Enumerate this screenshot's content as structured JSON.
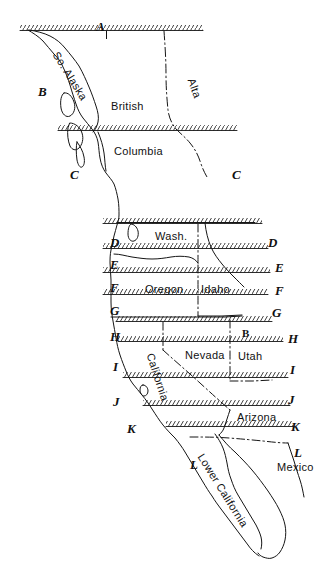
{
  "map": {
    "title": "Hand-drawn index map of Western North America",
    "background_color": "#ffffff",
    "ink_color": "#111111",
    "width": 323,
    "height": 579,
    "grid_letters_left": [
      "B",
      "C",
      "D",
      "E",
      "F",
      "G",
      "H",
      "I",
      "J",
      "K",
      "L"
    ],
    "grid_letters_right": [
      "C",
      "D",
      "E",
      "F",
      "G",
      "H",
      "I",
      "J",
      "K",
      "L"
    ],
    "grid_letter_top": "A"
  },
  "grid": {
    "top": {
      "letter": "A",
      "x": 96,
      "y": 20
    },
    "left": [
      {
        "letter": "B",
        "x": 38,
        "y": 85
      },
      {
        "letter": "C",
        "x": 70,
        "y": 168
      },
      {
        "letter": "D",
        "x": 110,
        "y": 236
      },
      {
        "letter": "E",
        "x": 110,
        "y": 258
      },
      {
        "letter": "F",
        "x": 110,
        "y": 281
      },
      {
        "letter": "G",
        "x": 110,
        "y": 304
      },
      {
        "letter": "H",
        "x": 110,
        "y": 330
      },
      {
        "letter": "I",
        "x": 113,
        "y": 360
      },
      {
        "letter": "J",
        "x": 113,
        "y": 395
      },
      {
        "letter": "K",
        "x": 127,
        "y": 422
      },
      {
        "letter": "L",
        "x": 190,
        "y": 458
      }
    ],
    "right": [
      {
        "letter": "C",
        "x": 232,
        "y": 168
      },
      {
        "letter": "D",
        "x": 268,
        "y": 236
      },
      {
        "letter": "E",
        "x": 275,
        "y": 261
      },
      {
        "letter": "F",
        "x": 275,
        "y": 284
      },
      {
        "letter": "G",
        "x": 272,
        "y": 306
      },
      {
        "letter": "H",
        "x": 288,
        "y": 332
      },
      {
        "letter": "I",
        "x": 290,
        "y": 363
      },
      {
        "letter": "J",
        "x": 288,
        "y": 393
      },
      {
        "letter": "K",
        "x": 291,
        "y": 420
      },
      {
        "letter": "L",
        "x": 294,
        "y": 446
      }
    ],
    "marker_b_small": {
      "letter": "B",
      "x": 242,
      "y": 328
    }
  },
  "places": [
    {
      "name": "So. Alaska",
      "x": 60,
      "y": 50,
      "rotate": 58,
      "size": 11
    },
    {
      "name": "British",
      "x": 111,
      "y": 101,
      "rotate": 0,
      "size": 11
    },
    {
      "name": "Columbia",
      "x": 114,
      "y": 146,
      "rotate": 0,
      "size": 11
    },
    {
      "name": "Alta",
      "x": 196,
      "y": 77,
      "rotate": 70,
      "size": 11
    },
    {
      "name": "Wash.",
      "x": 155,
      "y": 231,
      "rotate": 0,
      "size": 11
    },
    {
      "name": "Oregon",
      "x": 145,
      "y": 284,
      "rotate": 0,
      "size": 11
    },
    {
      "name": "Idaho",
      "x": 201,
      "y": 284,
      "rotate": 0,
      "size": 11
    },
    {
      "name": "Nevada",
      "x": 185,
      "y": 350,
      "rotate": 0,
      "size": 11
    },
    {
      "name": "Utah",
      "x": 238,
      "y": 351,
      "rotate": 0,
      "size": 11
    },
    {
      "name": "California",
      "x": 155,
      "y": 352,
      "rotate": 72,
      "size": 11
    },
    {
      "name": "Arizona",
      "x": 237,
      "y": 412,
      "rotate": 0,
      "size": 11
    },
    {
      "name": "Lower California",
      "x": 205,
      "y": 452,
      "rotate": 58,
      "size": 11
    },
    {
      "name": "Mexico",
      "x": 277,
      "y": 462,
      "rotate": 0,
      "size": 11
    }
  ],
  "hatched_bands": [
    {
      "id": "band-a",
      "x1": 20,
      "x2": 203,
      "y": 29
    },
    {
      "id": "band-c",
      "x1": 58,
      "x2": 237,
      "y": 129
    },
    {
      "id": "band-d",
      "x1": 103,
      "x2": 262,
      "y": 222
    },
    {
      "id": "band-e",
      "x1": 103,
      "x2": 268,
      "y": 247
    },
    {
      "id": "band-f",
      "x1": 103,
      "x2": 270,
      "y": 271
    },
    {
      "id": "band-g",
      "x1": 103,
      "x2": 268,
      "y": 293
    },
    {
      "id": "band-h",
      "x1": 116,
      "x2": 272,
      "y": 320
    },
    {
      "id": "band-i",
      "x1": 118,
      "x2": 283,
      "y": 340
    },
    {
      "id": "band-j",
      "x1": 123,
      "x2": 288,
      "y": 376
    },
    {
      "id": "band-k",
      "x1": 143,
      "x2": 290,
      "y": 404
    },
    {
      "id": "band-l",
      "x1": 166,
      "x2": 293,
      "y": 425
    }
  ]
}
